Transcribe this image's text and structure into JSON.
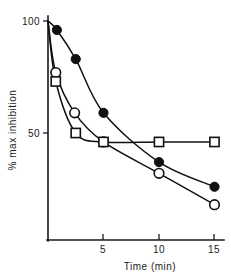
{
  "chart_data": {
    "type": "line",
    "title": "",
    "xlabel": "Time (min)",
    "ylabel": "% max inhibition",
    "xlim": [
      0,
      16
    ],
    "ylim": [
      0,
      105
    ],
    "xticks": [
      5,
      10,
      15
    ],
    "xticklabels": [
      "5",
      "10",
      "15"
    ],
    "yticks": [
      50,
      100
    ],
    "yticklabels": [
      "50",
      "100"
    ],
    "grid": false,
    "legend": "none",
    "series": [
      {
        "name": "filled-circle",
        "marker": "filled circle",
        "x": [
          0,
          0.8,
          2.5,
          5,
          10,
          15
        ],
        "y": [
          100,
          96,
          83,
          59,
          37,
          26
        ]
      },
      {
        "name": "open-circle",
        "marker": "open circle",
        "x": [
          0,
          0.7,
          2.4,
          5,
          10,
          15
        ],
        "y": [
          100,
          77,
          59,
          46,
          32,
          18
        ]
      },
      {
        "name": "open-square",
        "marker": "open square",
        "x": [
          0,
          0.7,
          2.5,
          5,
          10,
          15
        ],
        "y": [
          100,
          73,
          50,
          46,
          46,
          46
        ]
      }
    ]
  },
  "axes": {
    "x_title": "Time (min)",
    "y_title": "% max inhibition",
    "x_tick_5": "5",
    "x_tick_10": "10",
    "x_tick_15": "15",
    "y_tick_50": "50",
    "y_tick_100": "100"
  }
}
